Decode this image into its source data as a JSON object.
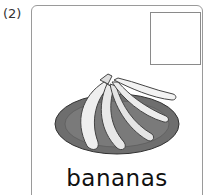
{
  "item": {
    "number": "(2)",
    "word": "bananas",
    "image": "bananas-on-plate",
    "answer_box": ""
  }
}
